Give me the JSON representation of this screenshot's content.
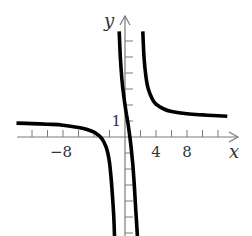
{
  "chart_data": {
    "type": "line",
    "title": "",
    "xlabel": "x",
    "ylabel": "y",
    "x_tick_labels": [
      {
        "value": -8,
        "label": "−8"
      },
      {
        "value": 4,
        "label": "4"
      },
      {
        "value": 8,
        "label": "8"
      }
    ],
    "y_tick_labels": [
      {
        "value": 1,
        "label": "1"
      }
    ],
    "x_ticks": [
      -12,
      -10,
      -8,
      -6,
      -4,
      -2,
      2,
      4,
      6,
      8,
      10,
      12
    ],
    "y_ticks": [
      -6,
      -5,
      -4,
      -3,
      -2,
      -1,
      1,
      2,
      3,
      4,
      5,
      6
    ],
    "xlim": [
      -14,
      14.5
    ],
    "ylim": [
      -6.2,
      7.6
    ],
    "grid": false,
    "vertical_asymptotes": [
      -1,
      2
    ],
    "horizontal_asymptote": 1,
    "series": [
      {
        "name": "left-branch",
        "x": [
          -14,
          -12,
          -10,
          -8,
          -6,
          -5,
          -4,
          -3.5,
          -3,
          -2.5,
          -2.2,
          -2,
          -1.8,
          -1.6,
          -1.45,
          -1.35
        ],
        "y": [
          0.87,
          0.84,
          0.8,
          0.74,
          0.6,
          0.48,
          0.3,
          0.14,
          -0.1,
          -0.55,
          -1.05,
          -1.6,
          -2.5,
          -3.8,
          -5.0,
          -6.2
        ]
      },
      {
        "name": "middle-branch",
        "x": [
          -0.75,
          -0.6,
          -0.4,
          -0.2,
          0,
          0.2,
          0.4,
          0.6,
          0.8,
          1.0,
          1.2,
          1.4,
          1.6
        ],
        "y": [
          6.6,
          5.0,
          3.6,
          2.7,
          2.0,
          1.4,
          0.8,
          0.1,
          -0.7,
          -1.7,
          -3.0,
          -4.6,
          -6.2
        ]
      },
      {
        "name": "right-branch",
        "x": [
          2.3,
          2.45,
          2.7,
          3.0,
          3.5,
          4,
          5,
          6,
          8,
          10,
          12,
          13.2
        ],
        "y": [
          6.6,
          5.0,
          3.8,
          3.0,
          2.4,
          2.05,
          1.75,
          1.6,
          1.45,
          1.38,
          1.33,
          1.3
        ]
      }
    ]
  }
}
